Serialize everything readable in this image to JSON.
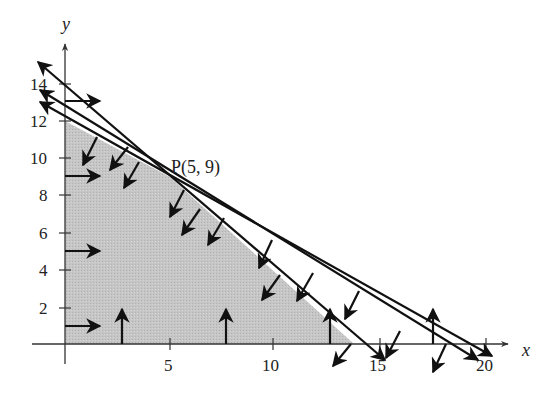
{
  "figure": {
    "title": "",
    "x_axis": {
      "label": "x",
      "ticks": [
        {
          "value": 5,
          "label": "5"
        },
        {
          "value": 10,
          "label": "10"
        },
        {
          "value": 15,
          "label": "15"
        },
        {
          "value": 20,
          "label": "20"
        }
      ]
    },
    "y_axis": {
      "label": "y",
      "ticks": [
        {
          "value": 2,
          "label": "2"
        },
        {
          "value": 4,
          "label": "4"
        },
        {
          "value": 6,
          "label": "6"
        },
        {
          "value": 8,
          "label": "8"
        },
        {
          "value": 10,
          "label": "10"
        },
        {
          "value": 12,
          "label": "12"
        },
        {
          "value": 14,
          "label": "14"
        }
      ]
    },
    "point": {
      "label": "P(5, 9)",
      "x": 5,
      "y": 9
    },
    "colors": {
      "feasible_region": "#c4c4c4",
      "lines": "#111111",
      "axes": "#333333",
      "background": "#ffffff"
    },
    "lines": [
      {
        "name": "line-1",
        "description": "steepest line through (0,14) and P(5,9), x-intercept 14"
      },
      {
        "name": "line-2",
        "description": "middle line through about (0,13) and P(5,9), x-intercept about 19"
      },
      {
        "name": "line-3",
        "description": "line through (0,12) and P(5,9), x-intercept 20"
      }
    ],
    "region": {
      "description": "shaded feasible region with vertices (0,0), (0,12), P(5,9), (14,0)"
    }
  }
}
